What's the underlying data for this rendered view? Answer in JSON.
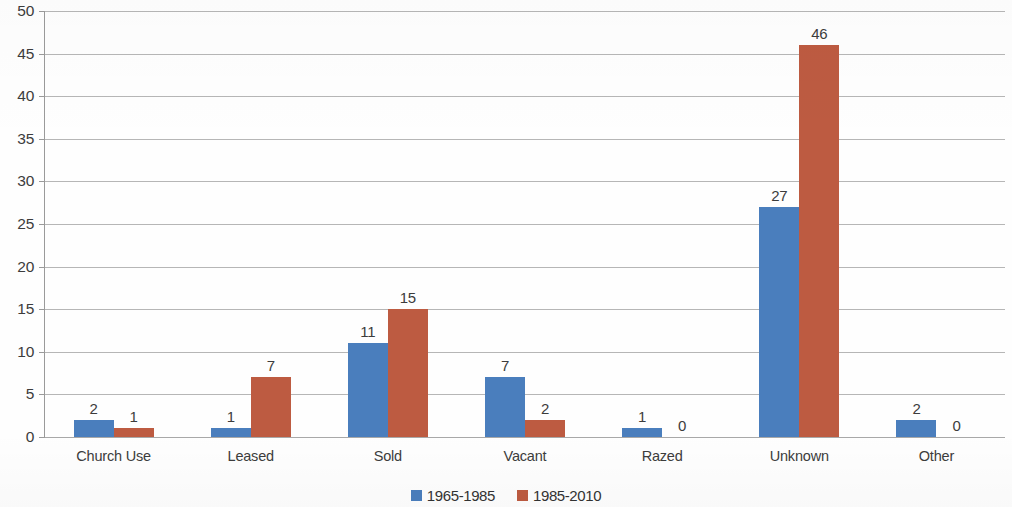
{
  "chart_data": {
    "type": "bar",
    "title": "",
    "subtitle": "",
    "xlabel": "",
    "ylabel": "",
    "categories": [
      "Church Use",
      "Leased",
      "Sold",
      "Vacant",
      "Razed",
      "Unknown",
      "Other"
    ],
    "series": [
      {
        "name": "1965-1985",
        "color": "#4a7ebd",
        "values": [
          2,
          1,
          11,
          7,
          1,
          27,
          2
        ]
      },
      {
        "name": "1985-2010",
        "color": "#bd5b41",
        "values": [
          1,
          7,
          15,
          2,
          0,
          46,
          0
        ]
      }
    ],
    "ylim": [
      0,
      50
    ],
    "ytick_step": 5,
    "yticks": [
      "0",
      "5",
      "10",
      "15",
      "20",
      "25",
      "30",
      "35",
      "40",
      "45",
      "50"
    ],
    "grid": true,
    "grid_axis": "y",
    "legend_position": "bottom",
    "data_labels": true,
    "bar_gap": 0
  },
  "legend": {
    "items": [
      {
        "label": "1965-1985",
        "swatch": "series-a"
      },
      {
        "label": "1985-2010",
        "swatch": "series-b"
      }
    ]
  },
  "colors": {
    "series_a": "#4a7ebd",
    "series_b": "#bd5b41",
    "gridline": "#b6b6b6",
    "axis": "#9a9a9a",
    "text": "#3c3c3c",
    "background": "#fefefe"
  }
}
